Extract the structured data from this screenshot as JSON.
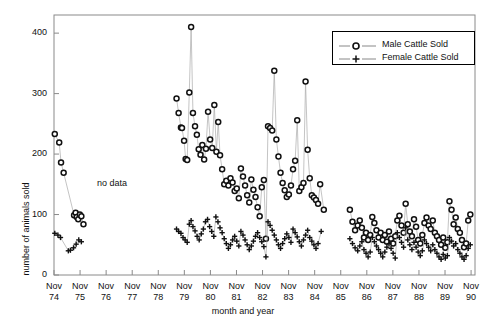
{
  "chart_data": {
    "type": "scatter",
    "title": "",
    "xlabel": "month and year",
    "ylabel": "number of animals sold",
    "ylim": [
      0,
      430
    ],
    "yticks": [
      0,
      100,
      200,
      300,
      400
    ],
    "xlim": [
      1974.85,
      1991.0
    ],
    "xticks": [
      1974.85,
      1975.85,
      1976.85,
      1977.85,
      1978.85,
      1979.85,
      1980.85,
      1981.85,
      1982.85,
      1983.85,
      1984.85,
      1985.85,
      1986.85,
      1987.85,
      1988.85,
      1989.85,
      1990.85
    ],
    "xticklabels": [
      "Nov\n74",
      "Nov\n75",
      "Nov\n76",
      "Nov\n77",
      "Nov\n78",
      "Nov\n79",
      "Nov\n80",
      "Nov\n81",
      "Nov\n82",
      "Nov\n83",
      "Nov\n84",
      "Nov\n85",
      "Nov\n86",
      "Nov\n87",
      "Nov\n88",
      "Nov\n89",
      "Nov\n90"
    ],
    "xtick_lines": [
      "Nov",
      "74"
    ],
    "grid": false,
    "legend_position": "top-right",
    "annotations": [
      {
        "text": "no data",
        "x": 1977.55,
        "y": 163
      }
    ],
    "series": [
      {
        "name": "Male Cattle Sold",
        "marker": "circle",
        "color": "#111111",
        "points": [
          [
            1974.88,
            233
          ],
          [
            1975.05,
            219
          ],
          [
            1975.12,
            186
          ],
          [
            1975.22,
            169
          ],
          [
            1975.62,
            99
          ],
          [
            1975.68,
            103
          ],
          [
            1975.72,
            96
          ],
          [
            1975.78,
            92
          ],
          [
            1975.84,
            100
          ],
          [
            1975.9,
            97
          ],
          [
            1975.98,
            84
          ],
          [
            1979.55,
            292
          ],
          [
            1979.63,
            268
          ],
          [
            1979.72,
            244
          ],
          [
            1979.76,
            243
          ],
          [
            1979.84,
            222
          ],
          [
            1979.9,
            192
          ],
          [
            1979.96,
            190
          ],
          [
            1980.04,
            302
          ],
          [
            1980.11,
            410
          ],
          [
            1980.18,
            268
          ],
          [
            1980.26,
            246
          ],
          [
            1980.33,
            232
          ],
          [
            1980.4,
            208
          ],
          [
            1980.47,
            199
          ],
          [
            1980.54,
            215
          ],
          [
            1980.61,
            191
          ],
          [
            1980.68,
            209
          ],
          [
            1980.76,
            270
          ],
          [
            1980.84,
            224
          ],
          [
            1980.92,
            210
          ],
          [
            1981.0,
            281
          ],
          [
            1981.08,
            204
          ],
          [
            1981.15,
            253
          ],
          [
            1981.22,
            198
          ],
          [
            1981.3,
            175
          ],
          [
            1981.38,
            150
          ],
          [
            1981.46,
            156
          ],
          [
            1981.54,
            148
          ],
          [
            1981.62,
            160
          ],
          [
            1981.7,
            153
          ],
          [
            1981.78,
            139
          ],
          [
            1981.86,
            143
          ],
          [
            1981.94,
            127
          ],
          [
            1982.02,
            176
          ],
          [
            1982.1,
            163
          ],
          [
            1982.18,
            148
          ],
          [
            1982.26,
            132
          ],
          [
            1982.34,
            120
          ],
          [
            1982.42,
            158
          ],
          [
            1982.5,
            141
          ],
          [
            1982.58,
            129
          ],
          [
            1982.66,
            112
          ],
          [
            1982.74,
            97
          ],
          [
            1982.82,
            145
          ],
          [
            1982.9,
            157
          ],
          [
            1982.98,
            60
          ],
          [
            1983.06,
            246
          ],
          [
            1983.14,
            243
          ],
          [
            1983.22,
            239
          ],
          [
            1983.3,
            338
          ],
          [
            1983.38,
            224
          ],
          [
            1983.46,
            196
          ],
          [
            1983.54,
            169
          ],
          [
            1983.62,
            152
          ],
          [
            1983.7,
            140
          ],
          [
            1983.78,
            129
          ],
          [
            1983.86,
            133
          ],
          [
            1983.94,
            148
          ],
          [
            1984.02,
            175
          ],
          [
            1984.1,
            189
          ],
          [
            1984.18,
            256
          ],
          [
            1984.26,
            139
          ],
          [
            1984.34,
            145
          ],
          [
            1984.42,
            152
          ],
          [
            1984.5,
            320
          ],
          [
            1984.58,
            207
          ],
          [
            1984.66,
            160
          ],
          [
            1984.74,
            132
          ],
          [
            1984.82,
            128
          ],
          [
            1984.9,
            124
          ],
          [
            1984.98,
            118
          ],
          [
            1985.06,
            150
          ],
          [
            1985.2,
            108
          ],
          [
            1986.2,
            108
          ],
          [
            1986.3,
            88
          ],
          [
            1986.4,
            74
          ],
          [
            1986.5,
            82
          ],
          [
            1986.58,
            90
          ],
          [
            1986.66,
            78
          ],
          [
            1986.74,
            62
          ],
          [
            1986.82,
            70
          ],
          [
            1986.9,
            58
          ],
          [
            1986.98,
            66
          ],
          [
            1987.06,
            96
          ],
          [
            1987.14,
            86
          ],
          [
            1987.22,
            74
          ],
          [
            1987.3,
            62
          ],
          [
            1987.38,
            70
          ],
          [
            1987.46,
            58
          ],
          [
            1987.54,
            66
          ],
          [
            1987.62,
            55
          ],
          [
            1987.7,
            72
          ],
          [
            1987.78,
            60
          ],
          [
            1987.86,
            52
          ],
          [
            1987.94,
            64
          ],
          [
            1988.02,
            90
          ],
          [
            1988.1,
            98
          ],
          [
            1988.18,
            82
          ],
          [
            1988.26,
            70
          ],
          [
            1988.34,
            118
          ],
          [
            1988.42,
            84
          ],
          [
            1988.5,
            72
          ],
          [
            1988.58,
            64
          ],
          [
            1988.66,
            92
          ],
          [
            1988.74,
            80
          ],
          [
            1988.82,
            58
          ],
          [
            1988.9,
            52
          ],
          [
            1988.98,
            66
          ],
          [
            1989.06,
            86
          ],
          [
            1989.14,
            95
          ],
          [
            1989.22,
            82
          ],
          [
            1989.3,
            76
          ],
          [
            1989.38,
            90
          ],
          [
            1989.46,
            70
          ],
          [
            1989.54,
            64
          ],
          [
            1989.62,
            58
          ],
          [
            1989.7,
            50
          ],
          [
            1989.78,
            62
          ],
          [
            1989.86,
            45
          ],
          [
            1989.94,
            54
          ],
          [
            1990.02,
            122
          ],
          [
            1990.1,
            108
          ],
          [
            1990.18,
            84
          ],
          [
            1990.26,
            95
          ],
          [
            1990.34,
            76
          ],
          [
            1990.42,
            70
          ],
          [
            1990.5,
            58
          ],
          [
            1990.58,
            46
          ],
          [
            1990.66,
            52
          ],
          [
            1990.74,
            90
          ],
          [
            1990.82,
            100
          ]
        ]
      },
      {
        "name": "Female Cattle Sold",
        "marker": "plus",
        "color": "#111111",
        "points": [
          [
            1974.88,
            69
          ],
          [
            1975.0,
            66
          ],
          [
            1975.1,
            62
          ],
          [
            1975.4,
            40
          ],
          [
            1975.48,
            41
          ],
          [
            1975.6,
            45
          ],
          [
            1975.7,
            51
          ],
          [
            1975.8,
            58
          ],
          [
            1975.9,
            55
          ],
          [
            1979.55,
            76
          ],
          [
            1979.63,
            72
          ],
          [
            1979.72,
            69
          ],
          [
            1979.8,
            62
          ],
          [
            1979.88,
            58
          ],
          [
            1979.96,
            54
          ],
          [
            1980.04,
            84
          ],
          [
            1980.11,
            90
          ],
          [
            1980.18,
            80
          ],
          [
            1980.26,
            73
          ],
          [
            1980.34,
            64
          ],
          [
            1980.42,
            58
          ],
          [
            1980.5,
            68
          ],
          [
            1980.58,
            76
          ],
          [
            1980.66,
            88
          ],
          [
            1980.74,
            92
          ],
          [
            1980.82,
            80
          ],
          [
            1980.9,
            72
          ],
          [
            1980.98,
            64
          ],
          [
            1981.06,
            96
          ],
          [
            1981.14,
            88
          ],
          [
            1981.22,
            78
          ],
          [
            1981.3,
            70
          ],
          [
            1981.38,
            60
          ],
          [
            1981.46,
            52
          ],
          [
            1981.54,
            44
          ],
          [
            1981.62,
            50
          ],
          [
            1981.7,
            58
          ],
          [
            1981.78,
            64
          ],
          [
            1981.86,
            56
          ],
          [
            1981.94,
            48
          ],
          [
            1982.02,
            72
          ],
          [
            1982.1,
            66
          ],
          [
            1982.18,
            58
          ],
          [
            1982.26,
            50
          ],
          [
            1982.34,
            42
          ],
          [
            1982.42,
            48
          ],
          [
            1982.5,
            56
          ],
          [
            1982.58,
            64
          ],
          [
            1982.66,
            70
          ],
          [
            1982.74,
            62
          ],
          [
            1982.82,
            55
          ],
          [
            1982.9,
            47
          ],
          [
            1982.98,
            30
          ],
          [
            1983.06,
            88
          ],
          [
            1983.14,
            82
          ],
          [
            1983.22,
            74
          ],
          [
            1983.3,
            66
          ],
          [
            1983.38,
            58
          ],
          [
            1983.46,
            50
          ],
          [
            1983.54,
            44
          ],
          [
            1983.62,
            52
          ],
          [
            1983.7,
            60
          ],
          [
            1983.78,
            68
          ],
          [
            1983.86,
            62
          ],
          [
            1983.94,
            54
          ],
          [
            1984.02,
            76
          ],
          [
            1984.1,
            70
          ],
          [
            1984.18,
            63
          ],
          [
            1984.26,
            55
          ],
          [
            1984.34,
            48
          ],
          [
            1984.42,
            58
          ],
          [
            1984.5,
            66
          ],
          [
            1984.58,
            74
          ],
          [
            1984.66,
            62
          ],
          [
            1984.74,
            56
          ],
          [
            1984.82,
            50
          ],
          [
            1984.9,
            44
          ],
          [
            1984.98,
            52
          ],
          [
            1985.1,
            72
          ],
          [
            1986.2,
            60
          ],
          [
            1986.3,
            52
          ],
          [
            1986.4,
            45
          ],
          [
            1986.5,
            40
          ],
          [
            1986.58,
            48
          ],
          [
            1986.66,
            55
          ],
          [
            1986.74,
            42
          ],
          [
            1986.82,
            36
          ],
          [
            1986.9,
            30
          ],
          [
            1986.98,
            38
          ],
          [
            1987.06,
            62
          ],
          [
            1987.14,
            55
          ],
          [
            1987.22,
            48
          ],
          [
            1987.3,
            42
          ],
          [
            1987.38,
            36
          ],
          [
            1987.46,
            30
          ],
          [
            1987.54,
            38
          ],
          [
            1987.62,
            46
          ],
          [
            1987.7,
            52
          ],
          [
            1987.78,
            44
          ],
          [
            1987.86,
            36
          ],
          [
            1987.94,
            28
          ],
          [
            1988.02,
            70
          ],
          [
            1988.1,
            62
          ],
          [
            1988.18,
            54
          ],
          [
            1988.26,
            46
          ],
          [
            1988.34,
            78
          ],
          [
            1988.42,
            58
          ],
          [
            1988.5,
            50
          ],
          [
            1988.58,
            42
          ],
          [
            1988.66,
            54
          ],
          [
            1988.74,
            46
          ],
          [
            1988.82,
            38
          ],
          [
            1988.9,
            32
          ],
          [
            1988.98,
            40
          ],
          [
            1989.06,
            58
          ],
          [
            1989.14,
            52
          ],
          [
            1989.22,
            46
          ],
          [
            1989.3,
            40
          ],
          [
            1989.38,
            50
          ],
          [
            1989.46,
            42
          ],
          [
            1989.54,
            36
          ],
          [
            1989.62,
            30
          ],
          [
            1989.7,
            26
          ],
          [
            1989.78,
            34
          ],
          [
            1989.86,
            28
          ],
          [
            1989.94,
            32
          ],
          [
            1990.02,
            62
          ],
          [
            1990.1,
            56
          ],
          [
            1990.18,
            48
          ],
          [
            1990.26,
            52
          ],
          [
            1990.34,
            42
          ],
          [
            1990.42,
            36
          ],
          [
            1990.5,
            30
          ],
          [
            1990.58,
            26
          ],
          [
            1990.66,
            32
          ],
          [
            1990.74,
            44
          ],
          [
            1990.82,
            50
          ]
        ]
      }
    ]
  },
  "legend": {
    "entries": [
      {
        "label": "Male Cattle Sold",
        "marker": "circle"
      },
      {
        "label": "Female Cattle Sold",
        "marker": "plus"
      }
    ]
  }
}
